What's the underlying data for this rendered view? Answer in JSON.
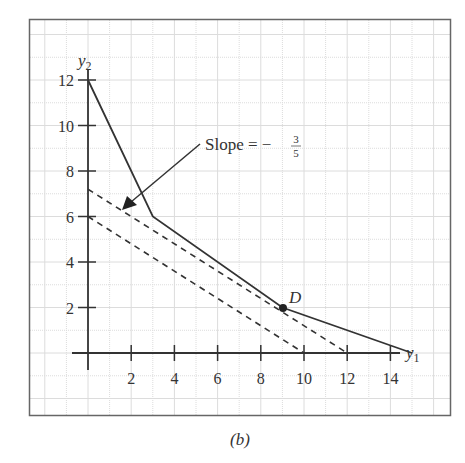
{
  "figure": {
    "caption": "(b)"
  },
  "chart_data": {
    "type": "line",
    "title": "",
    "xlabel": "y1",
    "ylabel": "y2",
    "xlim": [
      0,
      15
    ],
    "ylim": [
      0,
      12
    ],
    "grid": true,
    "x_ticks": [
      2,
      4,
      6,
      8,
      10,
      12,
      14
    ],
    "y_ticks": [
      2,
      4,
      6,
      8,
      10,
      12
    ],
    "series": [
      {
        "name": "boundary",
        "style": "solid",
        "points": [
          [
            0,
            12
          ],
          [
            3,
            6
          ],
          [
            9,
            2
          ],
          [
            15,
            0
          ]
        ]
      },
      {
        "name": "iso-line through D",
        "style": "dashed",
        "points": [
          [
            0,
            7.2
          ],
          [
            12,
            0
          ]
        ]
      },
      {
        "name": "iso-line lower",
        "style": "dashed",
        "points": [
          [
            0,
            6
          ],
          [
            10,
            0
          ]
        ]
      }
    ],
    "markers": [
      {
        "label": "D",
        "x": 9,
        "y": 2
      }
    ],
    "annotations": [
      {
        "text": "Slope = −",
        "fraction_num": "3",
        "fraction_den": "5",
        "arrow_to": [
          1.6,
          6.2
        ]
      }
    ]
  },
  "labels": {
    "x_axis": "y",
    "x_axis_sub": "1",
    "y_axis": "y",
    "y_axis_sub": "2",
    "point_d": "D",
    "slope_text": "Slope = −",
    "slope_num": "3",
    "slope_den": "5",
    "x_tick_labels": [
      "2",
      "4",
      "6",
      "8",
      "10",
      "12",
      "14"
    ],
    "y_tick_labels": [
      "2",
      "4",
      "6",
      "8",
      "10",
      "12"
    ]
  }
}
